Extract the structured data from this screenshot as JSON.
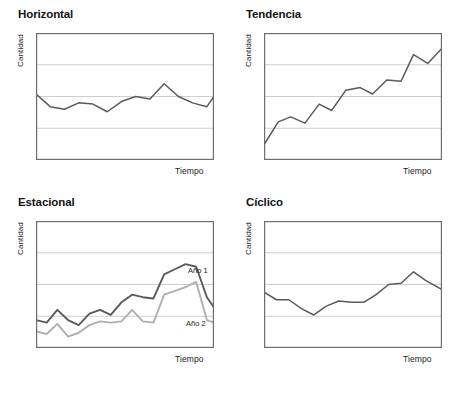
{
  "figure": {
    "colors": {
      "frame": "#6e6e6e",
      "grid": "#c9c9c9",
      "series_dark": "#5a5a5a",
      "series_light": "#b0b0b0",
      "text": "#1a1a1a",
      "background": "#ffffff"
    },
    "axis_labels": {
      "y": "Cantidad",
      "x": "Tiempo"
    }
  },
  "panels": [
    {
      "id": "horizontal",
      "title": "Horizontal",
      "ylabel": "Cantidad",
      "xlabel": "Tiempo",
      "chart_data": {
        "type": "line",
        "title": "Horizontal",
        "xlabel": "Tiempo",
        "ylabel": "Cantidad",
        "grid": true,
        "gridlines_y": [
          0.25,
          0.5,
          0.75
        ],
        "xlim": [
          0,
          100
        ],
        "ylim": [
          0,
          100
        ],
        "legend": "none",
        "series": [
          {
            "name": "Horizontal",
            "color": "#5a5a5a",
            "x": [
              0,
              8,
              16,
              24,
              32,
              40,
              48,
              56,
              64,
              72,
              80,
              88,
              96,
              100
            ],
            "y": [
              52,
              42,
              40,
              45,
              44,
              38,
              46,
              50,
              48,
              60,
              50,
              45,
              42,
              50
            ]
          }
        ]
      }
    },
    {
      "id": "tendencia",
      "title": "Tendencia",
      "ylabel": "Cantidad",
      "xlabel": "Tiempo",
      "chart_data": {
        "type": "line",
        "title": "Tendencia",
        "xlabel": "Tiempo",
        "ylabel": "Cantidad",
        "grid": true,
        "gridlines_y": [
          0.25,
          0.5,
          0.75
        ],
        "xlim": [
          0,
          100
        ],
        "ylim": [
          0,
          100
        ],
        "legend": "none",
        "series": [
          {
            "name": "Tendencia",
            "color": "#5a5a5a",
            "x": [
              0,
              8,
              15,
              23,
              31,
              38,
              46,
              54,
              61,
              69,
              77,
              84,
              92,
              100
            ],
            "y": [
              12,
              30,
              34,
              29,
              44,
              39,
              55,
              57,
              52,
              63,
              62,
              83,
              76,
              88
            ]
          }
        ]
      }
    },
    {
      "id": "estacional",
      "title": "Estacional",
      "ylabel": "Cantidad",
      "xlabel": "Tiempo",
      "series_labels": {
        "year1": "Año 1",
        "year2": "Año 2"
      },
      "chart_data": {
        "type": "line",
        "title": "Estacional",
        "xlabel": "Tiempo",
        "ylabel": "Cantidad",
        "grid": true,
        "gridlines_y": [
          0.25,
          0.5,
          0.75
        ],
        "xlim": [
          0,
          100
        ],
        "ylim": [
          0,
          100
        ],
        "legend": "inline-annotations",
        "annotations": [
          {
            "text": "Año 1",
            "x": 88,
            "y": 48
          },
          {
            "text": "Año 2",
            "x": 86,
            "y": 12
          }
        ],
        "series": [
          {
            "name": "Año 1",
            "color": "#5a5a5a",
            "x": [
              0,
              6,
              12,
              18,
              24,
              30,
              36,
              42,
              48,
              54,
              60,
              66,
              72,
              78,
              84,
              90,
              96,
              100
            ],
            "y": [
              22,
              20,
              30,
              22,
              18,
              27,
              30,
              26,
              36,
              42,
              40,
              39,
              58,
              62,
              66,
              64,
              40,
              32
            ]
          },
          {
            "name": "Año 2",
            "color": "#b0b0b0",
            "x": [
              0,
              6,
              12,
              18,
              24,
              30,
              36,
              42,
              48,
              54,
              60,
              66,
              72,
              78,
              84,
              90,
              96,
              100
            ],
            "y": [
              13,
              11,
              19,
              9,
              12,
              18,
              21,
              20,
              21,
              30,
              21,
              20,
              42,
              45,
              48,
              52,
              22,
              20
            ]
          }
        ]
      }
    },
    {
      "id": "ciclico",
      "title": "Cíclico",
      "ylabel": "Cantidad",
      "xlabel": "Tiempo",
      "chart_data": {
        "type": "line",
        "title": "Cíclico",
        "xlabel": "Tiempo",
        "ylabel": "Cantidad",
        "grid": true,
        "gridlines_y": [
          0.25,
          0.5,
          0.75
        ],
        "xlim": [
          0,
          100
        ],
        "ylim": [
          0,
          100
        ],
        "legend": "none",
        "series": [
          {
            "name": "Cíclico",
            "color": "#5a5a5a",
            "x": [
              0,
              7,
              14,
              21,
              28,
              35,
              42,
              49,
              56,
              63,
              70,
              77,
              84,
              91,
              100
            ],
            "y": [
              44,
              38,
              38,
              31,
              26,
              33,
              37,
              36,
              36,
              42,
              50,
              51,
              60,
              53,
              46
            ]
          }
        ]
      }
    }
  ]
}
